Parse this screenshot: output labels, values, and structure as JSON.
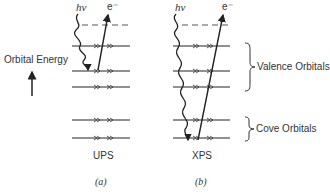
{
  "figure": {
    "axis_label": "Orbital Energy",
    "photon_label": "hν",
    "electron_label": "e⁻",
    "panels": [
      {
        "id": "a",
        "name": "UPS",
        "caption": "(a)"
      },
      {
        "id": "b",
        "name": "XPS",
        "caption": "(b)"
      }
    ],
    "groups": {
      "valence": "Valence Orbitals",
      "core": "Cove Orbitals"
    },
    "levels": {
      "vacuum_dashed_y": 25,
      "valence_y": [
        46,
        71,
        87
      ],
      "core_y": [
        120,
        138
      ]
    },
    "colors": {
      "line": "#222222",
      "text": "#333333",
      "background": "#ffffff"
    }
  }
}
